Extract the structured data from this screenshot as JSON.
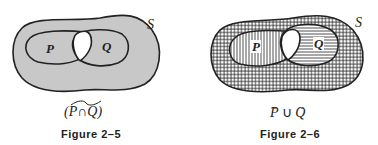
{
  "figures": [
    {
      "id": "figure-2-5",
      "universe_label": "S",
      "set_p_label": "P",
      "set_q_label": "Q",
      "expression": "(P∩Q)",
      "expression_overline": "tilde over whole",
      "caption": "Figure 2–5",
      "shading": "gray outside intersection"
    },
    {
      "id": "figure-2-6",
      "universe_label": "S",
      "set_p_label": "P",
      "set_q_label": "Q",
      "expression_p": "P",
      "expression_op": "∪",
      "expression_q": "Q",
      "caption": "Figure 2–6",
      "shading": "vertical lines on P-complement, horizontal lines on Q-complement, crosshatch on overlap"
    }
  ],
  "colors": {
    "shade_gray": "#c8c8c8",
    "ink": "#222222",
    "background": "#ffffff"
  }
}
